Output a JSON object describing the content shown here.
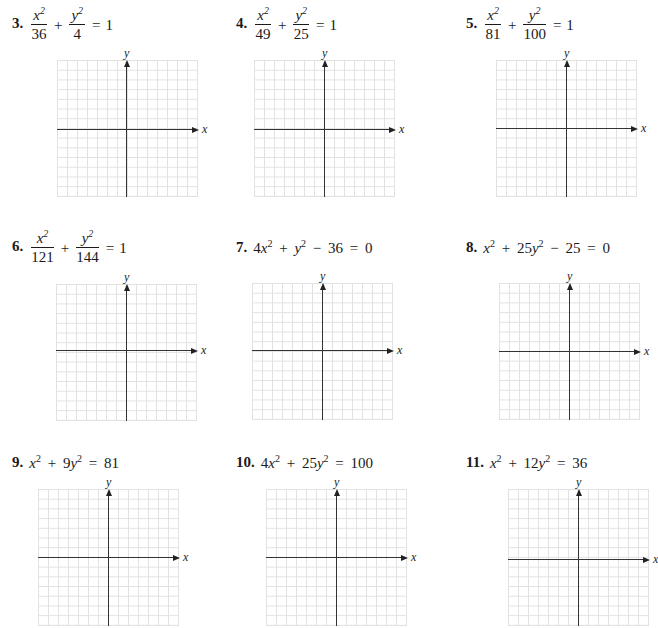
{
  "problems": [
    {
      "number": "3.",
      "type": "fraction",
      "x_num": "x",
      "x_den": "36",
      "y_num": "y",
      "y_den": "4",
      "rhs": "1",
      "label_pos": [
        12,
        8
      ],
      "grid": {
        "left": 57,
        "top": 60,
        "axis_x": 69,
        "axis_y": 69
      }
    },
    {
      "number": "4.",
      "type": "fraction",
      "x_num": "x",
      "x_den": "49",
      "y_num": "y",
      "y_den": "25",
      "rhs": "1",
      "label_pos": [
        236,
        8
      ],
      "grid": {
        "left": 254,
        "top": 60,
        "axis_x": 69,
        "axis_y": 70
      }
    },
    {
      "number": "5.",
      "type": "fraction",
      "x_num": "x",
      "x_den": "81",
      "y_num": "y",
      "y_den": "100",
      "rhs": "1",
      "label_pos": [
        466,
        8
      ],
      "grid": {
        "left": 496,
        "top": 60,
        "axis_x": 68,
        "axis_y": 70
      }
    },
    {
      "number": "6.",
      "type": "fraction",
      "x_num": "x",
      "x_den": "121",
      "y_num": "y",
      "y_den": "144",
      "rhs": "1",
      "label_pos": [
        12,
        231
      ],
      "grid": {
        "left": 56,
        "top": 284,
        "axis_x": 66,
        "axis_y": 70
      }
    },
    {
      "number": "7.",
      "type": "inline",
      "equation_text": "4x² + y² − 36 = 0",
      "label_pos": [
        236,
        240
      ],
      "grid": {
        "left": 252,
        "top": 283,
        "axis_x": 67,
        "axis_y": 70
      }
    },
    {
      "number": "8.",
      "type": "inline",
      "equation_text": "x² + 25y² − 25 = 0",
      "label_pos": [
        466,
        240
      ],
      "grid": {
        "left": 499,
        "top": 283,
        "axis_x": 68,
        "axis_y": 70
      }
    },
    {
      "number": "9.",
      "type": "inline",
      "equation_text": "x² + 9y² = 81",
      "label_pos": [
        12,
        455
      ],
      "grid": {
        "left": 38,
        "top": 489,
        "axis_x": 68,
        "axis_y": 70
      }
    },
    {
      "number": "10.",
      "type": "inline",
      "equation_text": "4x² + 25y² = 100",
      "label_pos": [
        236,
        455
      ],
      "grid": {
        "left": 266,
        "top": 489,
        "axis_x": 68,
        "axis_y": 70
      }
    },
    {
      "number": "11.",
      "type": "inline",
      "equation_text": "x² + 12y² = 36",
      "label_pos": [
        466,
        455
      ],
      "grid": {
        "left": 508,
        "top": 489,
        "axis_x": 70,
        "axis_y": 70
      }
    }
  ],
  "axis_labels": {
    "x": "x",
    "y": "y"
  },
  "symbols": {
    "plus": "+",
    "equals": "=",
    "squared": "2"
  },
  "colors": {
    "gridline": "#e2e2e2",
    "axis": "#333333",
    "text": "#1a1a1a"
  }
}
